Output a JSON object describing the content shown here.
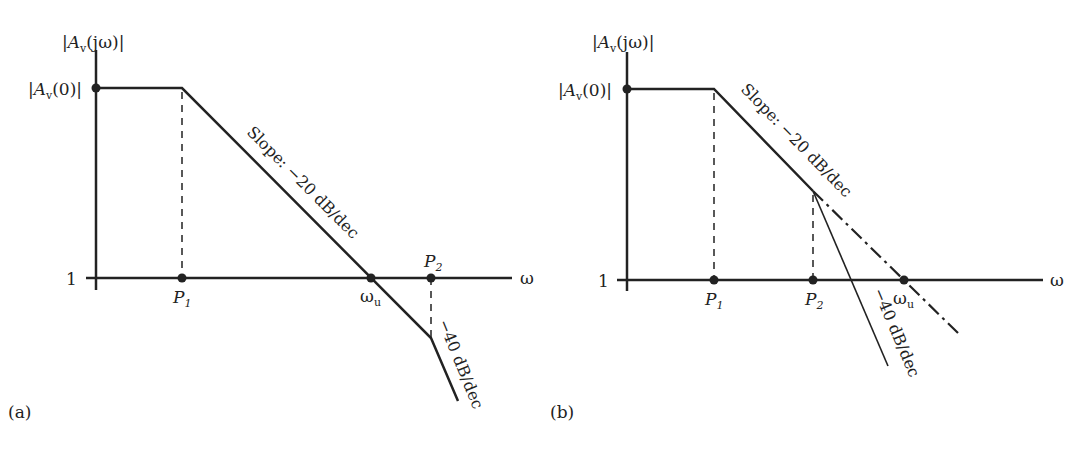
{
  "colors": {
    "ink": "#222222",
    "background": "#ffffff"
  },
  "panels": [
    {
      "id": "a",
      "panel_label": "(a)",
      "y_axis_label": {
        "pre": "|A",
        "sub": "v",
        "post": "(jω)|"
      },
      "y_top_label": {
        "pre": "|A",
        "sub": "v",
        "post": "(0)|"
      },
      "y_one_label": "1",
      "x_axis_label": "ω",
      "points": {
        "p1": {
          "main": "P",
          "sub": "1"
        },
        "wu": {
          "main": "ω",
          "sub": "u"
        },
        "p2": {
          "main": "P",
          "sub": "2"
        }
      },
      "slope1_label": "Slope: −20 dB/dec",
      "slope2_label": "−40 dB/dec"
    },
    {
      "id": "b",
      "panel_label": "(b)",
      "y_axis_label": {
        "pre": "|A",
        "sub": "v",
        "post": "(jω)|"
      },
      "y_top_label": {
        "pre": "|A",
        "sub": "v",
        "post": "(0)|"
      },
      "y_one_label": "1",
      "x_axis_label": "ω",
      "points": {
        "p1": {
          "main": "P",
          "sub": "1"
        },
        "p2": {
          "main": "P",
          "sub": "2"
        },
        "wu": {
          "main": "ω",
          "sub": "u"
        }
      },
      "slope1_label": "Slope: −20 dB/dec",
      "slope2_label": "−40 dB/dec"
    }
  ]
}
